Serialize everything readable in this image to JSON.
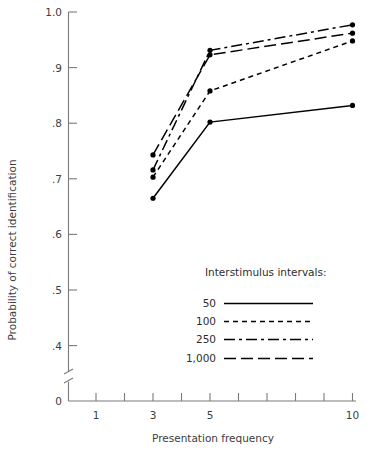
{
  "chart_data": {
    "type": "line",
    "title": "",
    "xlabel": "Presentation  frequency",
    "ylabel": "Probability of correct identification",
    "x": [
      3,
      5,
      10
    ],
    "xlim": [
      0.5,
      10.5
    ],
    "ylim": [
      0.35,
      1.0
    ],
    "grid": false,
    "axis_break": true,
    "x_ticks": [
      1,
      2,
      3,
      4,
      5,
      6,
      7,
      8,
      9,
      10
    ],
    "x_tick_labels": [
      "1",
      "",
      "3",
      "",
      "5",
      "",
      "",
      "",
      "",
      "10"
    ],
    "y_ticks": [
      1.0,
      0.9,
      0.8,
      0.7,
      0.6,
      0.5,
      0.4,
      0.0
    ],
    "y_tick_labels": [
      "1.0",
      ".9",
      ".8",
      ".7",
      ".6",
      ".5",
      ".4",
      "0"
    ],
    "legend_title": "Interstimulus intervals:",
    "legend_position": "inside lower-right",
    "series": [
      {
        "name": "50",
        "style": "solid",
        "dash": "none",
        "color": "#000000",
        "values": [
          0.665,
          0.802,
          0.832
        ]
      },
      {
        "name": "100",
        "style": "short-dash",
        "dash": "5,4",
        "color": "#000000",
        "values": [
          0.703,
          0.858,
          0.948
        ]
      },
      {
        "name": "250",
        "style": "dash-dot",
        "dash": "11,4,3,4",
        "color": "#000000",
        "values": [
          0.716,
          0.931,
          0.977
        ]
      },
      {
        "name": "1,000",
        "style": "long-dash",
        "dash": "12,5",
        "color": "#000000",
        "values": [
          0.743,
          0.923,
          0.962
        ]
      }
    ]
  },
  "axes": {
    "y_title": "Probability of correct identification",
    "x_title": "Presentation  frequency",
    "y_labels": {
      "t10": "1.0",
      "t9": ".9",
      "t8": ".8",
      "t7": ".7",
      "t6": ".6",
      "t5": ".5",
      "t4": ".4",
      "t0": "0"
    },
    "x_labels": {
      "x1": "1",
      "x3": "3",
      "x5": "5",
      "x10": "10"
    }
  },
  "legend": {
    "title": "Interstimulus intervals:",
    "entries": [
      {
        "label": "50"
      },
      {
        "label": "100"
      },
      {
        "label": "250"
      },
      {
        "label": "1,000"
      }
    ]
  }
}
